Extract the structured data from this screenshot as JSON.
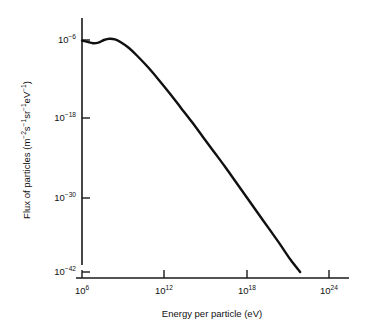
{
  "chart_data": {
    "type": "line",
    "title": "",
    "subtitle": "",
    "xlabel": "Energy per particle (eV)",
    "ylabel": "Flux of particles (m−2s−1sr−1eV−1)",
    "ylabel_parts": {
      "lead": "Flux of particles (m",
      "e1": "−2",
      "s": "s",
      "e2": "−1",
      "sr": "sr",
      "e3": "−1",
      "ev": "eV",
      "e4": "−1",
      "close": ")"
    },
    "x_scale": "log10",
    "y_scale": "log10",
    "xlim": [
      4.0,
      26.2
    ],
    "ylim": [
      -43.5,
      -2.0
    ],
    "xticks": [
      6,
      12,
      18,
      24
    ],
    "xtick_labels": [
      "10⁶",
      "10¹²",
      "10¹⁸",
      "10²⁴"
    ],
    "xtick_mantissa": "10",
    "xtick_exponents": [
      "6",
      "12",
      "18",
      "24"
    ],
    "yticks": [
      -6,
      -18,
      -30,
      -42
    ],
    "ytick_labels": [
      "10⁻⁶",
      "10⁻¹⁸",
      "10⁻³⁰",
      "10⁻⁴²"
    ],
    "ytick_mantissa": "10",
    "ytick_exponents": [
      "−6",
      "−18",
      "−30",
      "−42"
    ],
    "grid": false,
    "legend": false,
    "legend_position": "none",
    "series": [
      {
        "name": "Cosmic ray flux",
        "color": "#101010",
        "x": [
          6.0,
          6.4,
          6.8,
          7.2,
          7.6,
          8.0,
          8.4,
          8.8,
          9.4,
          10.0,
          10.8,
          11.6,
          12.4,
          13.2,
          14.0,
          14.8,
          15.6,
          16.4,
          17.2,
          18.0,
          18.8,
          19.6,
          20.4,
          21.2,
          21.9
        ],
        "y": [
          -6.1,
          -6.3,
          -6.5,
          -6.4,
          -6.0,
          -5.8,
          -5.9,
          -6.3,
          -7.2,
          -8.4,
          -10.2,
          -12.2,
          -14.3,
          -16.5,
          -18.7,
          -21.0,
          -23.3,
          -25.6,
          -28.0,
          -30.4,
          -32.8,
          -35.2,
          -37.6,
          -40.1,
          -42.0
        ]
      }
    ],
    "annotations": []
  },
  "axes": {
    "y_axis_name": "flux-axis",
    "x_axis_name": "energy-axis"
  }
}
